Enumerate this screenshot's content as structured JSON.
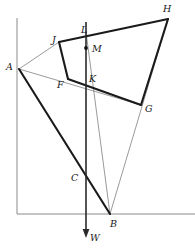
{
  "figure": {
    "canvas": {
      "width": 195,
      "height": 249
    },
    "colors": {
      "background": "#ffffff",
      "thick_stroke": "#1a1a1a",
      "thin_stroke": "#6e6e6e",
      "frame_stroke": "#8a8a8a",
      "axis_stroke": "#2a2a2a",
      "label_text": "#171717",
      "point_marker": "#121212"
    },
    "stroke_widths": {
      "thick": 2.1,
      "medium": 1.5,
      "thin": 0.7,
      "frame": 1.0,
      "axis": 1.6
    }
  },
  "points": {
    "A": {
      "x": 19,
      "y": 69
    },
    "B": {
      "x": 110,
      "y": 214
    },
    "C": {
      "x": 83,
      "y": 182
    },
    "F": {
      "x": 68,
      "y": 79
    },
    "G": {
      "x": 141,
      "y": 105
    },
    "H": {
      "x": 168,
      "y": 19
    },
    "J": {
      "x": 59,
      "y": 42
    },
    "K": {
      "x": 86,
      "y": 80
    },
    "L": {
      "x": 86,
      "y": 32
    },
    "M": {
      "x": 86,
      "y": 48
    },
    "W": {
      "x": 86,
      "y": 238
    }
  },
  "labels": [
    {
      "id": "label-A",
      "text": "A",
      "x": 6,
      "y": 62
    },
    {
      "id": "label-B",
      "text": "B",
      "x": 110,
      "y": 219
    },
    {
      "id": "label-C",
      "text": "C",
      "x": 71,
      "y": 173
    },
    {
      "id": "label-F",
      "text": "F",
      "x": 57,
      "y": 80
    },
    {
      "id": "label-G",
      "text": "G",
      "x": 145,
      "y": 104
    },
    {
      "id": "label-H",
      "text": "H",
      "x": 163,
      "y": 4
    },
    {
      "id": "label-J",
      "text": "J",
      "x": 52,
      "y": 35
    },
    {
      "id": "label-K",
      "text": "K",
      "x": 89,
      "y": 74
    },
    {
      "id": "label-L",
      "text": "L",
      "x": 81,
      "y": 25
    },
    {
      "id": "label-M",
      "text": "M",
      "x": 92,
      "y": 44
    },
    {
      "id": "label-W",
      "text": "W",
      "x": 90,
      "y": 233
    }
  ],
  "segments": {
    "thick": [
      {
        "name": "segment-J-H",
        "from": "J",
        "to": "H"
      },
      {
        "name": "segment-H-G",
        "from": "H",
        "to": "G"
      },
      {
        "name": "segment-G-F",
        "from": "G",
        "to": "F"
      },
      {
        "name": "segment-F-J",
        "from": "F",
        "to": "J"
      },
      {
        "name": "segment-A-B",
        "from": "A",
        "to": "B"
      }
    ],
    "thin": [
      {
        "name": "segment-A-J",
        "from": "A",
        "to": "J"
      },
      {
        "name": "segment-A-G",
        "from": "A",
        "to": "G"
      },
      {
        "name": "segment-B-L",
        "from": "B",
        "to": "L"
      },
      {
        "name": "segment-B-H",
        "from": "B",
        "to": "H"
      }
    ]
  },
  "frame": {
    "name": "axis-frame",
    "vertical_x": 17,
    "vertical_top_y": 18,
    "vertical_bottom_y": 214,
    "horizontal_y": 214,
    "horizontal_left_x": 17,
    "horizontal_right_x": 195
  },
  "weight_vector": {
    "name": "weight-arrow",
    "label": "W",
    "x": 86,
    "top_y": 22,
    "tip_y": 238,
    "arrow_half_width": 3.4,
    "arrow_length": 9
  },
  "point_marker": {
    "name": "point-M-dot",
    "x": 86,
    "y": 48,
    "radius": 1.9
  }
}
